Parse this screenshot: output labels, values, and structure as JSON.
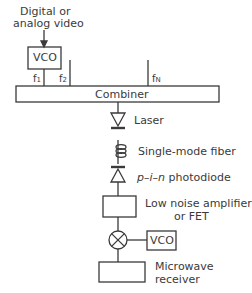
{
  "diagram": {
    "input_label_line1": "Digital or",
    "input_label_line2": "analog video",
    "vco_top": "VCO",
    "freq_labels": [
      "f1",
      "f2",
      "fN"
    ],
    "freq_display": {
      "f1_base": "f",
      "f1_sub": "1",
      "f2_base": "f",
      "f2_sub": "2",
      "fN_base": "f",
      "fN_sub": "N"
    },
    "combiner": "Combiner",
    "laser": "Laser",
    "fiber": "Single-mode fiber",
    "photodiode_italic": "p–i–n",
    "photodiode_rest": " photodiode",
    "amplifier_line1": "Low noise amplifier",
    "amplifier_line2": "or FET",
    "vco_bottom": "VCO",
    "receiver_line1": "Microwave",
    "receiver_line2": "receiver",
    "line_color": "#3a3a3a"
  }
}
